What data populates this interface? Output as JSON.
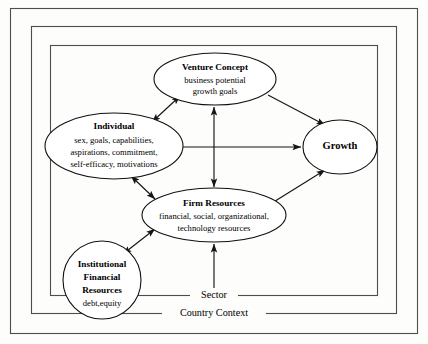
{
  "figure": {
    "background_color": "#fdfdfc",
    "line_color": "#151515",
    "frame_color": "#4d4d4d"
  },
  "frames": [
    {
      "id": "outer",
      "label": "",
      "x": 10,
      "y": 8,
      "width": 408,
      "height": 326
    },
    {
      "id": "country",
      "label": "Country Context",
      "x": 31,
      "y": 26,
      "width": 366,
      "height": 288,
      "label_x": 214,
      "label_y": 325
    },
    {
      "id": "sector",
      "label": "Sector",
      "x": 50,
      "y": 45,
      "width": 328,
      "height": 251,
      "label_x": 214,
      "label_y": 304
    }
  ],
  "nodes": [
    {
      "id": "venture-concept",
      "shape": "ellipse",
      "cx": 215,
      "cy": 79,
      "rx": 61,
      "ry": 26,
      "title": "Venture Concept",
      "lines": [
        "business potential",
        "growth goals"
      ]
    },
    {
      "id": "individual",
      "shape": "ellipse",
      "cx": 114,
      "cy": 146,
      "rx": 69,
      "ry": 33,
      "title": "Individual",
      "lines": [
        "sex, goals, capabilities,",
        "aspirations, commitment,",
        "self-efficacy, motivations"
      ]
    },
    {
      "id": "firm-resources",
      "shape": "ellipse",
      "cx": 214,
      "cy": 215,
      "rx": 72,
      "ry": 27,
      "title": "Firm Resources",
      "lines": [
        "financial, social, organizational,",
        "technology resources"
      ]
    },
    {
      "id": "institutional-financial-resources",
      "shape": "circle",
      "cx": 102,
      "cy": 280,
      "rx": 39,
      "ry": 39,
      "title": "Institutional\nFinancial\nResources",
      "lines": [
        "debt,equity"
      ]
    },
    {
      "id": "growth",
      "shape": "ellipse",
      "cx": 340,
      "cy": 147,
      "rx": 37,
      "ry": 27,
      "title": "Growth",
      "lines": []
    }
  ],
  "connectors": [
    {
      "id": "individual-venture",
      "from": "individual",
      "to": "venture-concept",
      "arrow": "double"
    },
    {
      "id": "venture-firm",
      "from": "venture-concept",
      "to": "firm-resources",
      "arrow": "double"
    },
    {
      "id": "individual-firm",
      "from": "individual",
      "to": "firm-resources",
      "arrow": "double"
    },
    {
      "id": "institutional-firm",
      "from": "institutional-financial-resources",
      "to": "firm-resources",
      "arrow": "double"
    },
    {
      "id": "individual-growth",
      "from": "individual",
      "to": "growth",
      "arrow": "single"
    },
    {
      "id": "venture-growth",
      "from": "venture-concept",
      "to": "growth",
      "arrow": "single"
    },
    {
      "id": "firm-growth",
      "from": "firm-resources",
      "to": "growth",
      "arrow": "single"
    },
    {
      "id": "sector-firm",
      "from": "sector",
      "to": "firm-resources",
      "arrow": "single"
    }
  ]
}
